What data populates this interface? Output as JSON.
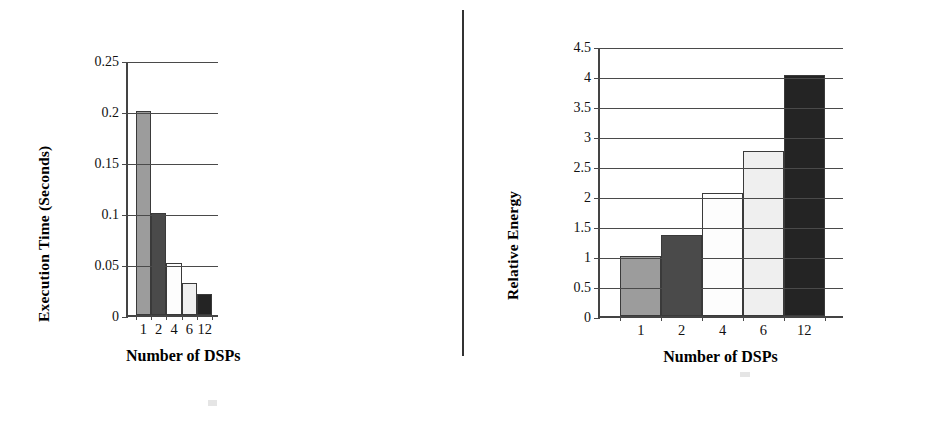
{
  "figure": {
    "background": "#ffffff",
    "divider_color": "#333333",
    "axis_color": "#444444",
    "grid_color": "#4a4a4a"
  },
  "palette": {
    "bar_1": "#9c9c9c",
    "bar_2": "#4a4a4a",
    "bar_4": "#fdfdfd",
    "bar_6": "#efefef",
    "bar_12": "#242424",
    "bar_outline": "#3a3a3a"
  },
  "chart_data": [
    {
      "type": "bar",
      "id": "execution-time",
      "title": "",
      "xlabel": "Number of DSPs",
      "ylabel": "Execution Time (Seconds)",
      "categories": [
        "1",
        "2",
        "4",
        "6",
        "12"
      ],
      "values": [
        0.2,
        0.1,
        0.051,
        0.031,
        0.021
      ],
      "bar_colors": [
        "#9c9c9c",
        "#4a4a4a",
        "#fdfdfd",
        "#efefef",
        "#242424"
      ],
      "ylim": [
        0,
        0.25
      ],
      "yticks": [
        0,
        0.05,
        0.1,
        0.15,
        0.2,
        0.25
      ],
      "ytick_labels": [
        "0",
        "0.05",
        "0.1",
        "0.15",
        "0.2",
        "0.25"
      ],
      "grid": true,
      "legend": "none"
    },
    {
      "type": "bar",
      "id": "relative-energy",
      "title": "",
      "xlabel": "Number of DSPs",
      "ylabel": "Relative Energy",
      "categories": [
        "1",
        "2",
        "4",
        "6",
        "12"
      ],
      "values": [
        1.0,
        1.35,
        2.05,
        2.75,
        4.02
      ],
      "bar_colors": [
        "#9c9c9c",
        "#4a4a4a",
        "#fdfdfd",
        "#efefef",
        "#242424"
      ],
      "ylim": [
        0,
        4.5
      ],
      "yticks": [
        0,
        0.5,
        1,
        1.5,
        2,
        2.5,
        3,
        3.5,
        4,
        4.5
      ],
      "ytick_labels": [
        "0",
        "0.5",
        "1",
        "1.5",
        "2",
        "2.5",
        "3",
        "3.5",
        "4",
        "4.5"
      ],
      "grid": true,
      "legend": "none"
    }
  ]
}
